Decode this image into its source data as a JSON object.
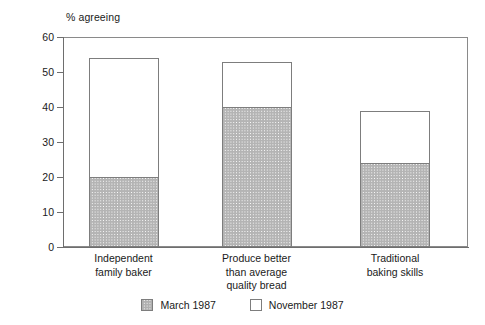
{
  "chart_data": {
    "type": "bar",
    "stacked": true,
    "title": "",
    "subtitle": "",
    "xlabel": "",
    "ylabel": "% agreeing",
    "ylim": [
      0,
      60
    ],
    "yticks": [
      0,
      10,
      20,
      30,
      40,
      50,
      60
    ],
    "grid": false,
    "legend_position": "bottom-center",
    "categories": [
      "Independent\nfamily baker",
      "Produce better\nthan average\nquality bread",
      "Traditional\nbaking skills"
    ],
    "series": [
      {
        "name": "March 1987",
        "values": [
          20,
          40,
          24
        ],
        "fill": "cross-hatch"
      },
      {
        "name": "November 1987",
        "values": [
          34,
          13,
          15
        ],
        "fill": "white"
      }
    ],
    "totals": [
      54,
      53,
      39
    ],
    "annotations": []
  },
  "axis": {
    "y_title": "% agreeing",
    "tick_labels": [
      "60",
      "50",
      "40",
      "30",
      "20",
      "10",
      "0"
    ]
  },
  "categories": [
    {
      "line1": "Independent",
      "line2": "family baker",
      "line3": ""
    },
    {
      "line1": "Produce better",
      "line2": "than average",
      "line3": "quality bread"
    },
    {
      "line1": "Traditional",
      "line2": "baking skills",
      "line3": ""
    }
  ],
  "legend": {
    "items": [
      {
        "label": "March 1987",
        "swatch": "cross-hatch-swatch"
      },
      {
        "label": "November 1987",
        "swatch": "white-swatch"
      }
    ]
  },
  "colors": {
    "axis": "#6e6e6e",
    "frame": "#8a8a8a",
    "bar_outline": "#7d7d7d",
    "hatch": "#b4b4b4",
    "background": "#ffffff",
    "text": "#1a1a1a"
  }
}
